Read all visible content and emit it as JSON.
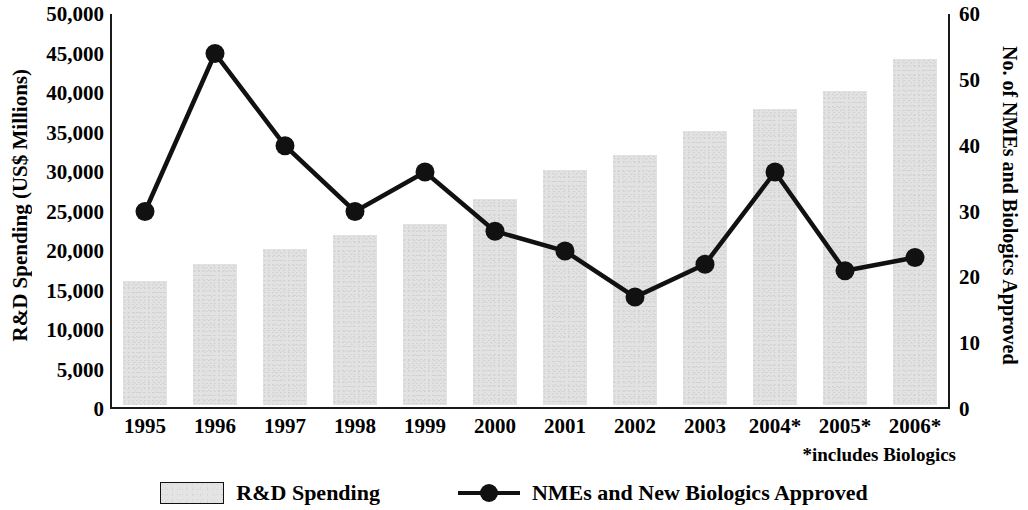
{
  "chart_data": {
    "type": "bar",
    "title": "",
    "categories": [
      "1995",
      "1996",
      "1997",
      "1998",
      "1999",
      "2000",
      "2001",
      "2002",
      "2003",
      "2004*",
      "2005*",
      "2006*"
    ],
    "xlabel": "",
    "ylabel": "R&D Spending (US$ Millions)",
    "y2label": "No. of NMEs and Biologics Approved",
    "ylim": [
      0,
      50000
    ],
    "y2lim": [
      0,
      60
    ],
    "yticks": [
      "0",
      "5,000",
      "10,000",
      "15,000",
      "20,000",
      "25,000",
      "30,000",
      "35,000",
      "40,000",
      "45,000",
      "50,000"
    ],
    "ytick_values": [
      0,
      5000,
      10000,
      15000,
      20000,
      25000,
      30000,
      35000,
      40000,
      45000,
      50000
    ],
    "y2ticks": [
      "0",
      "10",
      "20",
      "30",
      "40",
      "50",
      "60"
    ],
    "y2tick_values": [
      0,
      10,
      20,
      30,
      40,
      50,
      60
    ],
    "grid": false,
    "legend_position": "bottom",
    "series": [
      {
        "name": "R&D Spending",
        "type": "bar",
        "axis": "left",
        "color": "#e2e2e2",
        "values": [
          15700,
          17800,
          19700,
          21500,
          22900,
          26100,
          29800,
          31600,
          34700,
          37500,
          39700,
          43800
        ]
      },
      {
        "name": "NMEs and New Biologics Approved",
        "type": "line",
        "axis": "right",
        "color": "#111111",
        "values": [
          30,
          54,
          40,
          30,
          36,
          27,
          24,
          17,
          22,
          36,
          21,
          23
        ]
      }
    ],
    "annotations": [
      "*includes Biologics"
    ]
  },
  "axes": {
    "left_title": "R&D Spending (US$ Millions)",
    "right_title": "No. of NMEs and Biologics Approved"
  },
  "legend": {
    "items": [
      {
        "label": "R&D Spending",
        "marker": "bar-swatch"
      },
      {
        "label": "NMEs and New Biologics Approved",
        "marker": "line-dot-swatch"
      }
    ]
  },
  "footnote": "*includes Biologics"
}
